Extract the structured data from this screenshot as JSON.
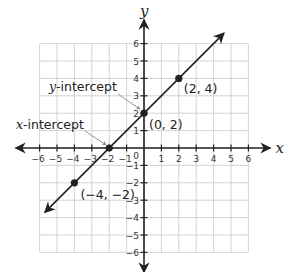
{
  "chart_data": {
    "type": "line",
    "title": "",
    "xlabel": "x",
    "ylabel": "y",
    "xlim": [
      -6,
      6
    ],
    "ylim": [
      -6,
      6
    ],
    "grid": true,
    "x_ticks": [
      -6,
      -5,
      -4,
      -3,
      -2,
      -1,
      1,
      2,
      3,
      4,
      5,
      6
    ],
    "y_ticks": [
      -6,
      -5,
      -4,
      -3,
      -2,
      -1,
      1,
      2,
      3,
      4,
      5,
      6
    ],
    "origin_label": "0",
    "series": [
      {
        "name": "y = x + 2",
        "slope": 1,
        "intercept": 2,
        "line_extent": {
          "x_start": -5.7,
          "y_start": -3.7,
          "x_end": 4.6,
          "y_end": 6.6
        },
        "points": [
          {
            "x": -4,
            "y": -2,
            "label": "(−4, −2)"
          },
          {
            "x": -2,
            "y": 0,
            "label": ""
          },
          {
            "x": 0,
            "y": 2,
            "label": "(0, 2)"
          },
          {
            "x": 2,
            "y": 4,
            "label": "(2, 4)"
          }
        ]
      }
    ],
    "annotations": [
      {
        "italic": "x",
        "text": "-intercept",
        "target": {
          "x": -2,
          "y": 0
        }
      },
      {
        "italic": "y",
        "text": "-intercept",
        "target": {
          "x": 0,
          "y": 2
        }
      }
    ]
  },
  "colors": {
    "grid": "#c8c8c8",
    "axis": "#222222",
    "line": "#222222",
    "pointer": "#8a8a8a"
  }
}
